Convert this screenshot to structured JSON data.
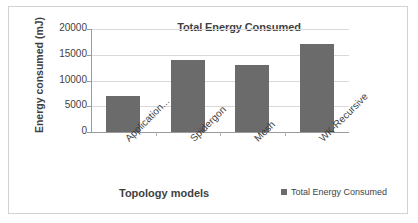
{
  "chart_data": {
    "type": "bar",
    "title": "Total Energy Consumed",
    "xlabel": "Topology models",
    "ylabel": "Energy consumed (mJ)",
    "categories": [
      "Application...",
      "Spidergon",
      "Mesh",
      "WK-Recursive"
    ],
    "values": [
      7000,
      13900,
      13000,
      17000
    ],
    "series": [
      {
        "name": "Total Energy Consumed",
        "values": [
          7000,
          13900,
          13000,
          17000
        ]
      }
    ],
    "ylim": [
      0,
      20000
    ],
    "yticks": [
      0,
      5000,
      10000,
      15000,
      20000
    ],
    "ytick_labels": [
      "0",
      "5000",
      "10000",
      "15000",
      "20000"
    ],
    "grid": true,
    "legend": {
      "position": "bottom-right",
      "entries": [
        {
          "label": "Total Energy Consumed",
          "color": "#6b6b6b"
        }
      ]
    },
    "bar_color": "#6b6b6b",
    "gridline_color": "#d9d9d9",
    "axis_color": "#9a9a9a",
    "text_color": "#3f3f3f"
  }
}
